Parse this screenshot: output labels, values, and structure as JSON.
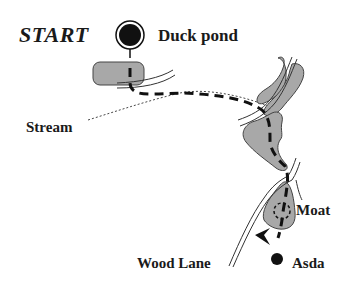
{
  "map": {
    "labels": {
      "start": "START",
      "duck_pond": "Duck pond",
      "stream": "Stream",
      "moat": "Moat",
      "wood_lane": "Wood Lane",
      "asda": "Asda"
    },
    "colors": {
      "pond_fill": "#a8a8a8",
      "route": "#111111",
      "background": "#ffffff"
    },
    "markers": {
      "start_marker": "large-black-circle-with-ring",
      "end_marker": "small-black-dot",
      "direction_arrow": "arrowhead-pointing-left"
    }
  }
}
